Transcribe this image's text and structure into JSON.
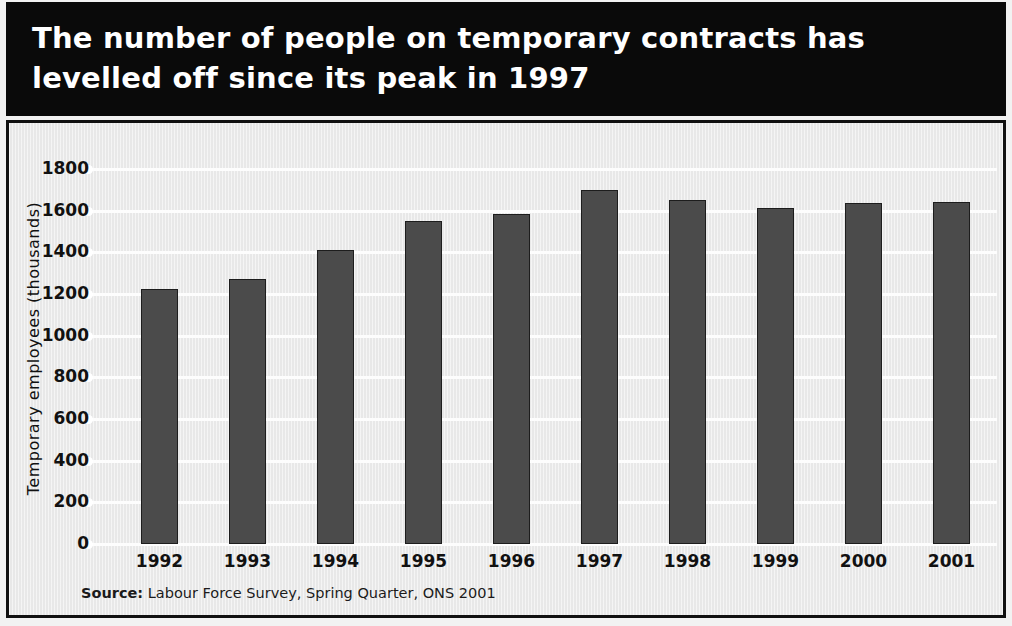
{
  "title": {
    "line1": "The number of people on temporary contracts has",
    "line2": "levelled off since its peak in 1997"
  },
  "source": {
    "label": "Source",
    "separator": ":",
    "text": "Labour Force Survey, Spring Quarter, ONS 2001"
  },
  "colors": {
    "banner_background": "#0a0a0a",
    "banner_text": "#ffffff",
    "panel_background": "#e8e8e8",
    "panel_border": "#111111",
    "bar_fill": "#4b4b4b",
    "bar_outline": "#1d1d1d",
    "gridline": "#fdfdfd",
    "text": "#111111"
  },
  "chart_data": {
    "type": "bar",
    "title": "The number of people on temporary contracts has levelled off since its peak in 1997",
    "xlabel": "",
    "ylabel": "Temporary employees (thousands)",
    "categories": [
      "1992",
      "1993",
      "1994",
      "1995",
      "1996",
      "1997",
      "1998",
      "1999",
      "2000",
      "2001"
    ],
    "values": [
      1225,
      1270,
      1410,
      1550,
      1585,
      1700,
      1650,
      1615,
      1635,
      1640
    ],
    "ylim": [
      0,
      1800
    ],
    "ytick_values": [
      0,
      200,
      400,
      600,
      800,
      1000,
      1200,
      1400,
      1600,
      1800
    ],
    "ytick_labels": [
      "0",
      "200",
      "400",
      "600",
      "800",
      "1000",
      "1200",
      "1400",
      "1600",
      "1800"
    ],
    "grid": true,
    "legend": false,
    "series": [
      {
        "name": "Temporary employees (thousands)",
        "values": [
          1225,
          1270,
          1410,
          1550,
          1585,
          1700,
          1650,
          1615,
          1635,
          1640
        ]
      }
    ],
    "annotations": [],
    "source": "Source: Labour Force Survey, Spring Quarter, ONS 2001"
  }
}
